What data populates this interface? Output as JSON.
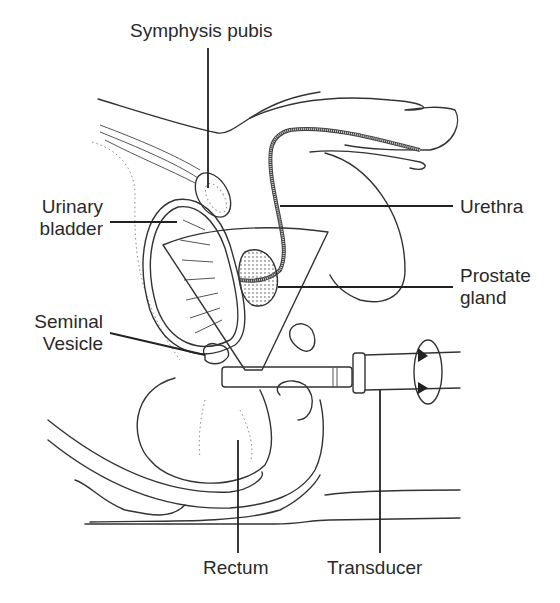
{
  "figure": {
    "labels": {
      "symphysis_pubis": "Symphysis pubis",
      "urinary_bladder_1": "Urinary",
      "urinary_bladder_2": "bladder",
      "urethra": "Urethra",
      "prostate_1": "Prostate",
      "prostate_2": "gland",
      "seminal_1": "Seminal",
      "seminal_2": "Vesicle",
      "rectum": "Rectum",
      "transducer": "Transducer"
    },
    "icons": {
      "rotation": "rotation-arrow-icon"
    },
    "colors": {
      "line": "#333333",
      "background": "#ffffff"
    }
  }
}
